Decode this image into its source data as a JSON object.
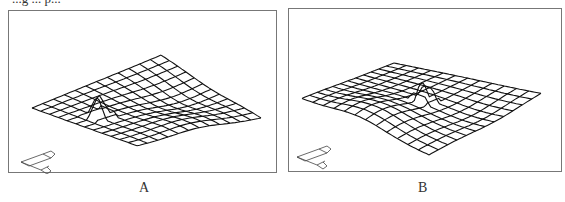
{
  "caption_fragment": "...g ... p...",
  "panels": [
    {
      "id": "A",
      "label": "A",
      "box": {
        "x": 8,
        "y": 10,
        "w": 269,
        "h": 163
      },
      "label_pos": {
        "x": 139,
        "y": 180
      },
      "mesh": {
        "rows": 12,
        "cols": 12,
        "corners": {
          "left": [
            23,
            97
          ],
          "top": [
            152,
            44
          ],
          "right": [
            252,
            107
          ],
          "bottom": [
            128,
            135
          ]
        },
        "peak": {
          "u": 0.18,
          "v": 0.42,
          "height": 22,
          "width": 0.06
        },
        "warp": [
          {
            "u": 0.75,
            "v": 0.5,
            "amp": -6
          },
          {
            "u": 0.5,
            "v": 0.9,
            "amp": 5
          }
        ]
      },
      "axes_icon": {
        "x": 12,
        "y": 145
      }
    },
    {
      "id": "B",
      "label": "B",
      "box": {
        "x": 288,
        "y": 8,
        "w": 274,
        "h": 164
      },
      "label_pos": {
        "x": 418,
        "y": 180
      },
      "mesh": {
        "rows": 12,
        "cols": 12,
        "corners": {
          "left": [
            13,
            90
          ],
          "top": [
            105,
            54
          ],
          "right": [
            252,
            84
          ],
          "bottom": [
            140,
            146
          ]
        },
        "peak": {
          "u": 0.55,
          "v": 0.52,
          "height": 22,
          "width": 0.05
        },
        "warp": [
          {
            "u": 0.15,
            "v": 0.45,
            "amp": 10
          },
          {
            "u": 0.6,
            "v": 0.85,
            "amp": -4
          }
        ]
      },
      "axes_icon": {
        "x": 8,
        "y": 142
      }
    }
  ],
  "colors": {
    "mesh": "#111111",
    "frame": "#777777",
    "icon": "#444444"
  }
}
